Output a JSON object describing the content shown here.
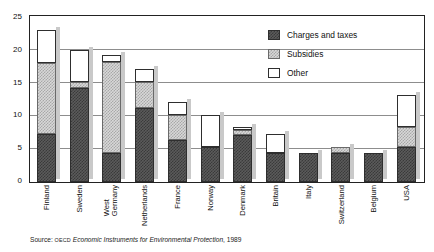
{
  "title_remnant": "",
  "legend": {
    "position": "top-right",
    "items": [
      {
        "label": "Charges and taxes",
        "key": "charges",
        "color": "#3a3a3a"
      },
      {
        "label": "Subsidies",
        "key": "subsidies",
        "color": "#a8a8a8"
      },
      {
        "label": "Other",
        "key": "other",
        "color": "#ffffff"
      }
    ]
  },
  "source": {
    "prefix": "Source:",
    "publisher": "OECD",
    "work": "Economic Instruments for Environmental Protection",
    "year": "1989"
  },
  "y_axis": {
    "ticks": [
      "0",
      "5",
      "10",
      "15",
      "20",
      "25"
    ],
    "min": 0,
    "max": 25
  },
  "chart_data": {
    "type": "bar",
    "title": "",
    "subtitle": "",
    "xlabel": "",
    "ylabel": "",
    "ylim": [
      0,
      25
    ],
    "yticks": [
      0,
      5,
      10,
      15,
      20,
      25
    ],
    "grid": true,
    "stacked": true,
    "legend_position": "top-right",
    "categories": [
      "Finland",
      "Sweden",
      "West Germany",
      "Netherlands",
      "France",
      "Norway",
      "Denmark",
      "Britain",
      "Italy",
      "Switzerland",
      "Belgium",
      "USA"
    ],
    "category_lines": [
      [
        "Finland"
      ],
      [
        "Sweden"
      ],
      [
        "West",
        "Germany"
      ],
      [
        "Netherlands"
      ],
      [
        "France"
      ],
      [
        "Norway"
      ],
      [
        "Denmark"
      ],
      [
        "Britain"
      ],
      [
        "Italy"
      ],
      [
        "Switzerland"
      ],
      [
        "Belgium"
      ],
      [
        "USA"
      ]
    ],
    "series": [
      {
        "name": "Charges and taxes",
        "values": [
          7.3,
          14.3,
          4.4,
          11.2,
          6.3,
          5.3,
          7.2,
          4.4,
          4.4,
          4.4,
          4.4,
          5.3
        ]
      },
      {
        "name": "Subsidies",
        "values": [
          10.8,
          0.9,
          13.8,
          4.0,
          3.9,
          0.0,
          0.7,
          0.0,
          0.0,
          0.9,
          0.0,
          3.0
        ]
      },
      {
        "name": "Other",
        "values": [
          5.0,
          4.9,
          1.0,
          2.0,
          2.0,
          4.8,
          0.4,
          2.9,
          0.0,
          0.0,
          0.0,
          4.9
        ]
      }
    ],
    "totals": [
      23.1,
      20.1,
      19.2,
      17.2,
      12.2,
      10.1,
      8.3,
      7.3,
      4.4,
      5.3,
      4.4,
      13.2
    ]
  }
}
